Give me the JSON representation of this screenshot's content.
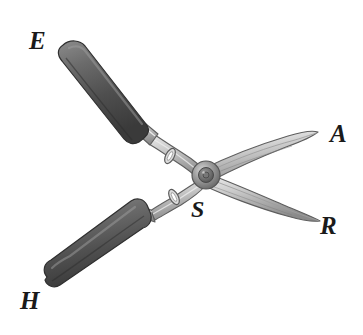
{
  "figure": {
    "object_name": "garden-hedge-shears",
    "background_color": "#ffffff",
    "labels": [
      {
        "id": "E",
        "text": "E",
        "role": "upper-handle-end",
        "x": 36,
        "y": 40
      },
      {
        "id": "A",
        "text": "A",
        "role": "upper-blade-tip",
        "x": 338,
        "y": 134
      },
      {
        "id": "R",
        "text": "R",
        "role": "lower-blade-tip",
        "x": 329,
        "y": 226
      },
      {
        "id": "S",
        "text": "S",
        "role": "pivot-lower-region",
        "x": 200,
        "y": 210
      },
      {
        "id": "H",
        "text": "H",
        "role": "lower-handle-end",
        "x": 28,
        "y": 300
      }
    ],
    "colors": {
      "handle_dark": "#5a5a5a",
      "handle_darker": "#3d3d3d",
      "handle_highlight": "#8a8a8a",
      "metal_light": "#e3e3e3",
      "metal_mid": "#b8b8b8",
      "metal_dark": "#8f8f8f",
      "outline": "#4a4a4a",
      "label_color": "#1a1a1a",
      "pivot_color": "#6f6f6f"
    },
    "geometry": {
      "pivot": {
        "x": 206,
        "y": 175,
        "r": 13
      },
      "upper_handle": {
        "x1": 64,
        "y1": 52,
        "x2": 158,
        "y2": 132
      },
      "lower_handle": {
        "x1": 50,
        "y1": 284,
        "x2": 150,
        "y2": 213
      },
      "upper_blade_tip": {
        "x": 317,
        "y": 133
      },
      "lower_blade_tip": {
        "x": 320,
        "y": 221
      }
    }
  }
}
